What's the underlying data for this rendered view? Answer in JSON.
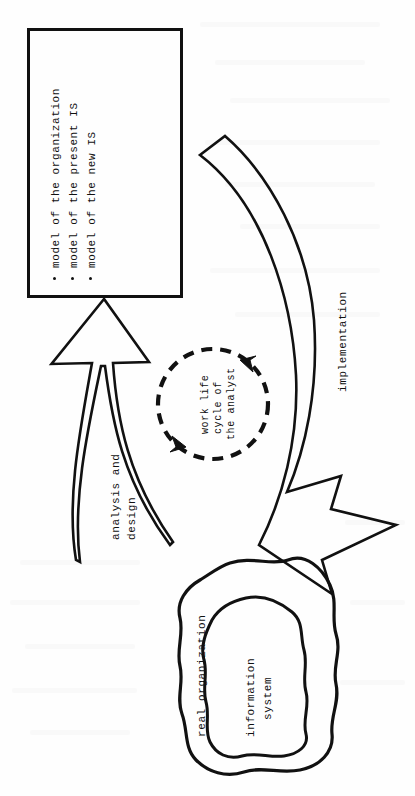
{
  "figure": {
    "name": "work-life-cycle-of-the-analyst-diagram",
    "orientation": "rotated-90-counterclockwise",
    "ink_color": "#111111",
    "page_color": "#fefefe"
  },
  "model_box": {
    "name": "models-box",
    "bullet_char": ".",
    "items": [
      {
        "label": "model of the organization"
      },
      {
        "label": "model of the present IS"
      },
      {
        "label": "model of the new IS"
      }
    ]
  },
  "cycle": {
    "name": "work-life-cycle-circle",
    "style": "dashed",
    "lines": [
      "work life",
      "cycle of",
      "the analyst"
    ],
    "text": "work life cycle of the analyst"
  },
  "arrows": {
    "left": {
      "name": "analysis-and-design-arrow",
      "lines": [
        "analysis and",
        "design"
      ],
      "label": "analysis and design",
      "direction": "organization-to-models"
    },
    "right": {
      "name": "implementation-arrow",
      "label": "implementation",
      "direction": "models-to-organization"
    }
  },
  "organization": {
    "name": "real-organization-blob",
    "label": "real organization",
    "inner": {
      "name": "information-system-blob",
      "lines": [
        "information",
        "system"
      ],
      "label": "information system"
    }
  }
}
